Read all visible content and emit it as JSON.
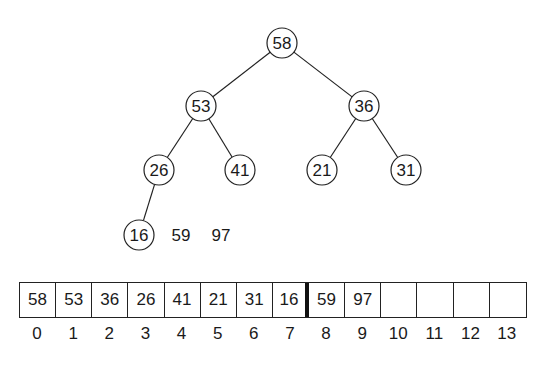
{
  "tree": {
    "nodes": [
      {
        "id": "n0",
        "value": "58",
        "x": 282,
        "y": 43
      },
      {
        "id": "n1",
        "value": "53",
        "x": 201,
        "y": 106
      },
      {
        "id": "n2",
        "value": "36",
        "x": 364,
        "y": 106
      },
      {
        "id": "n3",
        "value": "26",
        "x": 159,
        "y": 170
      },
      {
        "id": "n4",
        "value": "41",
        "x": 240,
        "y": 170
      },
      {
        "id": "n5",
        "value": "21",
        "x": 322,
        "y": 170
      },
      {
        "id": "n6",
        "value": "31",
        "x": 406,
        "y": 170
      },
      {
        "id": "n7",
        "value": "16",
        "x": 139,
        "y": 235
      }
    ],
    "edges": [
      [
        "n0",
        "n1"
      ],
      [
        "n0",
        "n2"
      ],
      [
        "n1",
        "n3"
      ],
      [
        "n1",
        "n4"
      ],
      [
        "n2",
        "n5"
      ],
      [
        "n2",
        "n6"
      ],
      [
        "n3",
        "n7"
      ]
    ],
    "free_values": [
      {
        "value": "59",
        "x": 181,
        "y": 235
      },
      {
        "value": "97",
        "x": 221,
        "y": 235
      }
    ]
  },
  "array": {
    "cells": [
      "58",
      "53",
      "36",
      "26",
      "41",
      "21",
      "31",
      "16",
      "59",
      "97",
      "",
      "",
      "",
      ""
    ],
    "indices": [
      "0",
      "1",
      "2",
      "3",
      "4",
      "5",
      "6",
      "7",
      "8",
      "9",
      "10",
      "11",
      "12",
      "13"
    ],
    "heap_boundary_after_index": 7
  }
}
